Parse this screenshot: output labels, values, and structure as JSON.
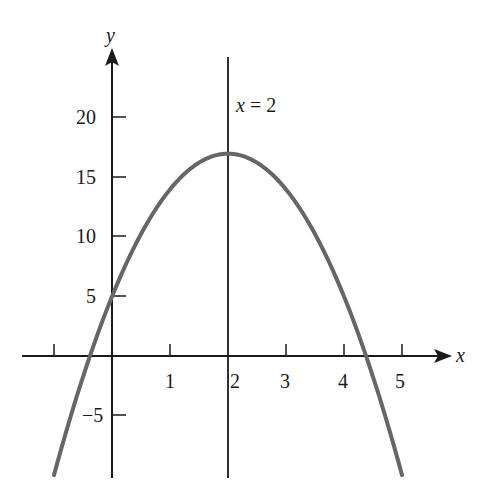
{
  "chart_data": {
    "type": "line",
    "title": "",
    "xlabel": "x",
    "ylabel": "y",
    "function": "y = -3x^2 + 12x + 5",
    "vertex": [
      2,
      17
    ],
    "axis_of_symmetry_label": "x = 2",
    "xlim": [
      -1.5,
      5.7
    ],
    "ylim": [
      -10,
      24
    ],
    "x_ticks": [
      -1,
      0,
      1,
      2,
      3,
      4,
      5
    ],
    "x_tick_labels": [
      "1",
      "2",
      "3",
      "4",
      "5"
    ],
    "y_ticks": [
      -5,
      5,
      10,
      15,
      20
    ],
    "y_tick_labels": [
      "−5",
      "5",
      "10",
      "15",
      "20"
    ],
    "grid": false,
    "series": [
      {
        "name": "parabola",
        "color": "#666666",
        "x": [
          -1,
          -0.5,
          0,
          0.5,
          1,
          1.5,
          2,
          2.5,
          3,
          3.5,
          4,
          4.5,
          5
        ],
        "values": [
          -10,
          -1.75,
          5,
          10.25,
          14,
          16.25,
          17,
          16.25,
          14,
          10.25,
          5,
          -1.75,
          -10
        ]
      }
    ]
  },
  "labels": {
    "x_axis": "x",
    "y_axis": "y",
    "symmetry": "x = 2",
    "xt1": "1",
    "xt2": "2",
    "xt3": "3",
    "xt4": "4",
    "xt5": "5",
    "yt20": "20",
    "yt15": "15",
    "yt10": "10",
    "yt5": "5",
    "ytm5": "−5"
  }
}
